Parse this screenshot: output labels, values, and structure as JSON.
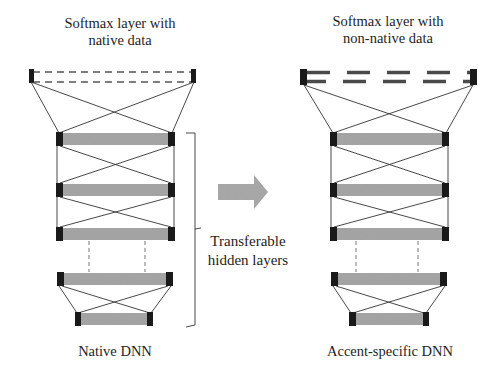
{
  "left_network": {
    "title_line1": "Softmax layer with",
    "title_line2": "native data",
    "caption": "Native DNN",
    "softmax_style": "thin-dashed"
  },
  "right_network": {
    "title_line1": "Softmax layer with",
    "title_line2": "non-native data",
    "caption": "Accent-specific DNN",
    "softmax_style": "thick-dashed"
  },
  "bracket_label": {
    "line1": "Transferable",
    "line2": "hidden layers"
  },
  "arrow": {
    "icon": "right-arrow-icon",
    "color": "#a9a9a9"
  },
  "colors": {
    "layer_fill": "#a6a6a6",
    "node_end": "#1a1a1a",
    "connection": "#333333",
    "text": "#1e1e1e"
  },
  "hidden_layer_count_visible": 5
}
